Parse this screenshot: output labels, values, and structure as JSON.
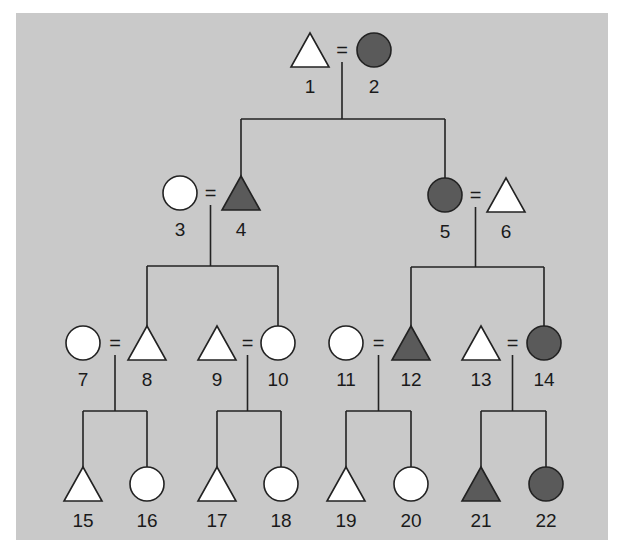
{
  "diagram": {
    "type": "pedigree",
    "colors": {
      "background": "#c9c9c9",
      "affected_fill": "#5a5a5a",
      "unaffected_fill": "#ffffff",
      "line": "#222222"
    },
    "legend_shapes": {
      "triangle": "male-icon",
      "circle": "female-icon"
    },
    "individuals": [
      {
        "id": "1",
        "shape": "triangle",
        "affected": false,
        "x": 310,
        "y": 50
      },
      {
        "id": "2",
        "shape": "circle",
        "affected": true,
        "x": 374,
        "y": 50
      },
      {
        "id": "3",
        "shape": "circle",
        "affected": false,
        "x": 180,
        "y": 193
      },
      {
        "id": "4",
        "shape": "triangle",
        "affected": true,
        "x": 241,
        "y": 193
      },
      {
        "id": "5",
        "shape": "circle",
        "affected": true,
        "x": 445,
        "y": 195
      },
      {
        "id": "6",
        "shape": "triangle",
        "affected": false,
        "x": 506,
        "y": 195
      },
      {
        "id": "7",
        "shape": "circle",
        "affected": false,
        "x": 83,
        "y": 343
      },
      {
        "id": "8",
        "shape": "triangle",
        "affected": false,
        "x": 147,
        "y": 343
      },
      {
        "id": "9",
        "shape": "triangle",
        "affected": false,
        "x": 217,
        "y": 343
      },
      {
        "id": "10",
        "shape": "circle",
        "affected": false,
        "x": 278,
        "y": 343
      },
      {
        "id": "11",
        "shape": "circle",
        "affected": false,
        "x": 346,
        "y": 343
      },
      {
        "id": "12",
        "shape": "triangle",
        "affected": true,
        "x": 411,
        "y": 343
      },
      {
        "id": "13",
        "shape": "triangle",
        "affected": false,
        "x": 481,
        "y": 343
      },
      {
        "id": "14",
        "shape": "circle",
        "affected": true,
        "x": 544,
        "y": 343
      },
      {
        "id": "15",
        "shape": "triangle",
        "affected": false,
        "x": 83,
        "y": 484
      },
      {
        "id": "16",
        "shape": "circle",
        "affected": false,
        "x": 147,
        "y": 484
      },
      {
        "id": "17",
        "shape": "triangle",
        "affected": false,
        "x": 217,
        "y": 484
      },
      {
        "id": "18",
        "shape": "circle",
        "affected": false,
        "x": 281,
        "y": 484
      },
      {
        "id": "19",
        "shape": "triangle",
        "affected": false,
        "x": 346,
        "y": 484
      },
      {
        "id": "20",
        "shape": "circle",
        "affected": false,
        "x": 411,
        "y": 484
      },
      {
        "id": "21",
        "shape": "triangle",
        "affected": true,
        "x": 481,
        "y": 484
      },
      {
        "id": "22",
        "shape": "circle",
        "affected": true,
        "x": 546,
        "y": 484
      }
    ],
    "marriages": [
      {
        "a": "1",
        "b": "2",
        "symbol": "="
      },
      {
        "a": "3",
        "b": "4",
        "symbol": "="
      },
      {
        "a": "5",
        "b": "6",
        "symbol": "="
      },
      {
        "a": "7",
        "b": "8",
        "symbol": "="
      },
      {
        "a": "9",
        "b": "10",
        "symbol": "="
      },
      {
        "a": "11",
        "b": "12",
        "symbol": "="
      },
      {
        "a": "13",
        "b": "14",
        "symbol": "="
      }
    ],
    "offspring": [
      {
        "parents": [
          "1",
          "2"
        ],
        "children": [
          "4",
          "5"
        ]
      },
      {
        "parents": [
          "3",
          "4"
        ],
        "children": [
          "8",
          "10"
        ]
      },
      {
        "parents": [
          "5",
          "6"
        ],
        "children": [
          "12",
          "14"
        ]
      },
      {
        "parents": [
          "7",
          "8"
        ],
        "children": [
          "15",
          "16"
        ]
      },
      {
        "parents": [
          "9",
          "10"
        ],
        "children": [
          "17",
          "18"
        ]
      },
      {
        "parents": [
          "11",
          "12"
        ],
        "children": [
          "19",
          "20"
        ]
      },
      {
        "parents": [
          "13",
          "14"
        ],
        "children": [
          "21",
          "22"
        ]
      }
    ]
  }
}
